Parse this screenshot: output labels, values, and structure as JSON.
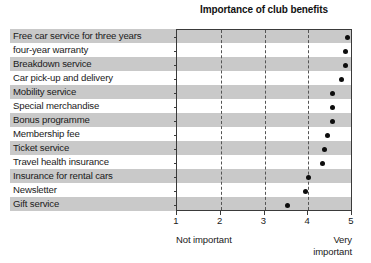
{
  "chart_data": {
    "type": "scatter",
    "title": "Importance of club benefits",
    "xlabel": "",
    "ylabel": "",
    "xlim": [
      1,
      5
    ],
    "xticks": [
      1,
      2,
      3,
      4,
      5
    ],
    "xticklabels": [
      "1",
      "2",
      "3",
      "4",
      "5"
    ],
    "grid": true,
    "grid_axis": "x",
    "legend": null,
    "axis_anchor_low": "Not important",
    "axis_anchor_high": "Very important",
    "categories": [
      "Free car service for three years",
      "four-year warranty",
      "Breakdown service",
      "Car pick-up and delivery",
      "Mobility service",
      "Special merchandise",
      "Bonus programme",
      "Membership fee",
      "Ticket service",
      "Travel health insurance",
      "Insurance for rental cars",
      "Newsletter",
      "Gift service"
    ],
    "values": [
      4.9,
      4.86,
      4.84,
      4.76,
      4.56,
      4.56,
      4.55,
      4.45,
      4.37,
      4.33,
      4.0,
      3.94,
      3.52
    ],
    "marker": "filled-circle",
    "marker_color": "#0d0d0d",
    "band_color": "#c9c9c9"
  }
}
